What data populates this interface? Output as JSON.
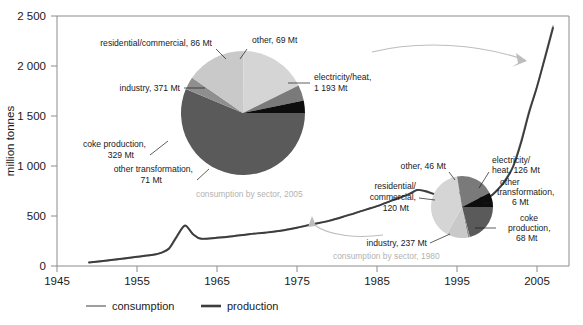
{
  "chart_data": {
    "type": "line",
    "title": "",
    "xlabel": "",
    "ylabel": "million tonnes",
    "xlim": [
      1945,
      2009
    ],
    "ylim": [
      0,
      2500
    ],
    "xticks": [
      "1945",
      "1955",
      "1965",
      "1975",
      "1985",
      "1995",
      "2005"
    ],
    "xtick_values": [
      1945,
      1955,
      1965,
      1975,
      1985,
      1995,
      2005
    ],
    "yticks": [
      "0",
      "500",
      "1 000",
      "1 500",
      "2 000",
      "2 500"
    ],
    "ytick_values": [
      0,
      500,
      1000,
      1500,
      2000,
      2500
    ],
    "grid": false,
    "legend_position": "bottom",
    "series": [
      {
        "name": "consumption",
        "color": "#9e9e9e",
        "x": [
          1949,
          1952,
          1955,
          1957,
          1958,
          1959,
          1960,
          1961,
          1962,
          1963,
          1965,
          1967,
          1969,
          1971,
          1973,
          1975,
          1977,
          1979,
          1981,
          1983,
          1985,
          1987,
          1989,
          1990,
          1991,
          1993,
          1995,
          1996,
          1997,
          1998,
          1999,
          2000,
          2001,
          2002,
          2003,
          2004,
          2005,
          2006,
          2007
        ],
        "values": [
          35,
          60,
          90,
          110,
          130,
          170,
          290,
          400,
          320,
          275,
          285,
          300,
          320,
          335,
          355,
          385,
          420,
          455,
          500,
          550,
          600,
          660,
          720,
          760,
          745,
          700,
          720,
          720,
          705,
          680,
          690,
          760,
          860,
          1000,
          1250,
          1550,
          1800,
          2100,
          2400
        ],
        "linewidth": 1.6
      },
      {
        "name": "production",
        "color": "#3d3d3d",
        "x": [
          1949,
          1952,
          1955,
          1957,
          1958,
          1959,
          1960,
          1961,
          1962,
          1963,
          1965,
          1967,
          1969,
          1971,
          1973,
          1975,
          1977,
          1979,
          1981,
          1983,
          1985,
          1987,
          1989,
          1990,
          1991,
          1993,
          1995,
          1996,
          1997,
          1998,
          1999,
          2000,
          2001,
          2002,
          2003,
          2004,
          2005,
          2006,
          2007
        ],
        "values": [
          35,
          62,
          92,
          112,
          132,
          175,
          300,
          405,
          318,
          272,
          282,
          298,
          318,
          333,
          352,
          382,
          418,
          452,
          498,
          548,
          598,
          658,
          718,
          760,
          750,
          705,
          730,
          735,
          715,
          685,
          690,
          755,
          850,
          990,
          1230,
          1530,
          1790,
          2080,
          2380
        ],
        "linewidth": 1.9
      }
    ],
    "pies": [
      {
        "id": "pie-2005",
        "caption": "consumption by sector, 2005",
        "center_x": 243,
        "center_y": 113,
        "radius": 62,
        "unit": "Mt",
        "slices": [
          {
            "label": "electricity/heat,",
            "label2": "1 193 Mt",
            "name": "electricity/heat",
            "value": 1193,
            "color": "#5a5a5a"
          },
          {
            "label": "other transformation,",
            "label2": "71 Mt",
            "name": "other transformation",
            "value": 71,
            "color": "#8f8f8f"
          },
          {
            "label": "coke production,",
            "label2": "329 Mt",
            "name": "coke production",
            "value": 329,
            "color": "#c9c9c9"
          },
          {
            "label": "industry, 371 Mt",
            "label2": "",
            "name": "industry",
            "value": 371,
            "color": "#d5d5d5"
          },
          {
            "label": "residential/commercial, 86 Mt",
            "label2": "",
            "name": "residential/commercial",
            "value": 86,
            "color": "#7a7a7a"
          },
          {
            "label": "other, 69 Mt",
            "label2": "",
            "name": "other",
            "value": 69,
            "color": "#0d0d0d"
          }
        ]
      },
      {
        "id": "pie-1980",
        "caption": "consumption by sector, 1980",
        "center_x": 462,
        "center_y": 207,
        "radius": 31,
        "unit": "Mt",
        "slices": [
          {
            "label": "electricity/",
            "label2": "heat, 126 Mt",
            "name": "electricity/heat",
            "value": 126,
            "color": "#5a5a5a"
          },
          {
            "label": "other",
            "label2": "transformation,",
            "label3": "6 Mt",
            "name": "other transformation",
            "value": 6,
            "color": "#8f8f8f"
          },
          {
            "label": "coke",
            "label2": "production,",
            "label3": "68 Mt",
            "name": "coke production",
            "value": 68,
            "color": "#c9c9c9"
          },
          {
            "label": "industry, 237 Mt",
            "label2": "",
            "name": "industry",
            "value": 237,
            "color": "#d5d5d5"
          },
          {
            "label": "residential/",
            "label2": "commercial,",
            "label3": "120 Mt",
            "name": "residential/commercial",
            "value": 120,
            "color": "#7a7a7a"
          },
          {
            "label": "other, 46 Mt",
            "label2": "",
            "name": "other",
            "value": 46,
            "color": "#0d0d0d"
          }
        ]
      }
    ]
  },
  "axes": {
    "y_title": "million tonnes",
    "y_ticks": [
      "2 500",
      "2 000",
      "1 500",
      "1 000",
      "500",
      "0"
    ],
    "x_ticks": [
      "1945",
      "1955",
      "1965",
      "1975",
      "1985",
      "1995",
      "2005"
    ]
  },
  "legend": {
    "items": [
      {
        "label": "consumption",
        "color": "#9e9e9e"
      },
      {
        "label": "production",
        "color": "#3d3d3d"
      }
    ]
  },
  "pie_2005": {
    "caption": "consumption by sector, 2005",
    "labels": {
      "residential_commercial": "residential/commercial, 86 Mt",
      "other": "other, 69 Mt",
      "industry": "industry, 371 Mt",
      "electricity_heat_l1": "electricity/heat,",
      "electricity_heat_l2": "1 193 Mt",
      "coke_l1": "coke production,",
      "coke_l2": "329 Mt",
      "other_transformation_l1": "other transformation,",
      "other_transformation_l2": "71 Mt"
    }
  },
  "pie_1980": {
    "caption": "consumption by sector, 1980",
    "labels": {
      "other": "other, 46 Mt",
      "electricity_heat_l1": "electricity/",
      "electricity_heat_l2": "heat, 126 Mt",
      "other_transformation_l1": "other",
      "other_transformation_l2": "transformation,",
      "other_transformation_l3": "6 Mt",
      "coke_l1": "coke",
      "coke_l2": "production,",
      "coke_l3": "68 Mt",
      "industry": "industry, 237 Mt",
      "residential_l1": "residential/",
      "residential_l2": "commercial,",
      "residential_l3": "120 Mt"
    }
  }
}
